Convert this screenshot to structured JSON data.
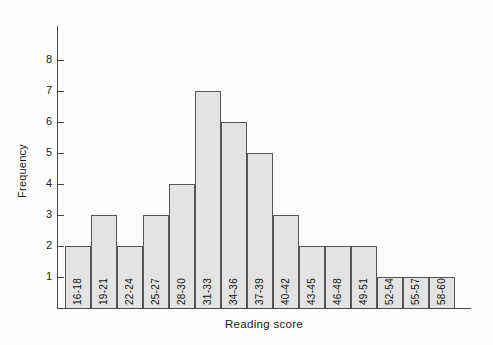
{
  "chart_data": {
    "type": "bar",
    "title": "",
    "subtitle": "",
    "xlabel": "Reading score",
    "ylabel": "Frequency",
    "categories": [
      "16-18",
      "19-21",
      "22-24",
      "25-27",
      "28-30",
      "31-33",
      "34-36",
      "37-39",
      "40-42",
      "43-45",
      "46-48",
      "49-51",
      "52-54",
      "55-57",
      "58-60"
    ],
    "values": [
      2,
      3,
      2,
      3,
      4,
      7,
      6,
      5,
      3,
      2,
      2,
      2,
      1,
      1,
      1
    ],
    "ylim": [
      0,
      8.8
    ],
    "y_ticks": [
      1,
      2,
      3,
      4,
      5,
      6,
      7,
      8
    ],
    "grid": false,
    "legend": false,
    "legend_position": "none",
    "bar_fill_color": "#e3e3e3",
    "bar_edge_color": "#555555",
    "axis_color": "#4a4a4a",
    "background_color": "#fefefe"
  }
}
